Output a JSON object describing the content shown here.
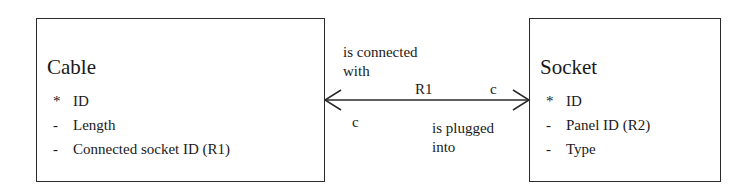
{
  "diagram": {
    "type": "entity-relationship",
    "entities": [
      {
        "name": "Cable",
        "attributes": [
          {
            "marker": "*",
            "name": "ID"
          },
          {
            "marker": "-",
            "name": "Length"
          },
          {
            "marker": "-",
            "name": "Connected socket ID (R1)"
          }
        ]
      },
      {
        "name": "Socket",
        "attributes": [
          {
            "marker": "*",
            "name": "ID"
          },
          {
            "marker": "-",
            "name": "Panel ID (R2)"
          },
          {
            "marker": "-",
            "name": "Type"
          }
        ]
      }
    ],
    "relationship": {
      "id": "R1",
      "forward_phrase": "is connected\nwith",
      "reverse_phrase": "is plugged\ninto",
      "cardinality_cable_end": "c",
      "cardinality_socket_end": "c",
      "line_color": "#2a2a2a"
    }
  }
}
